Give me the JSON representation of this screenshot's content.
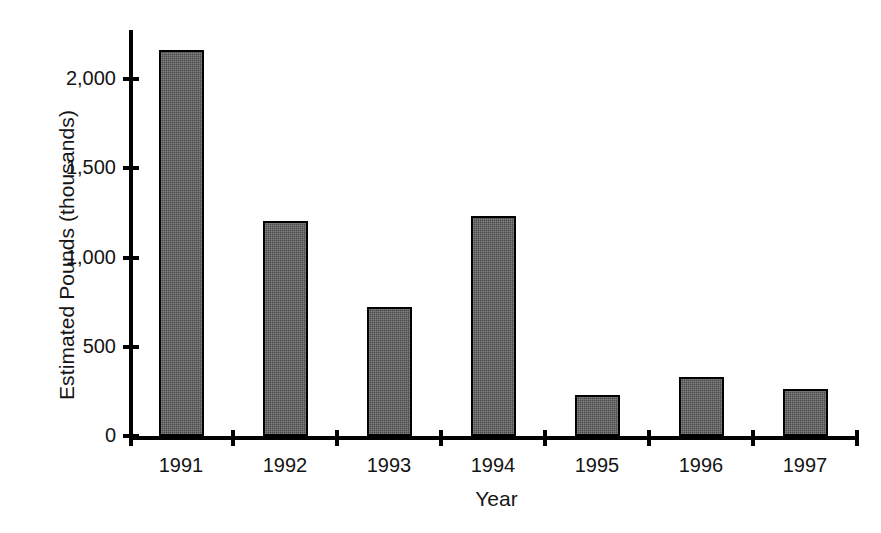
{
  "chart_data": {
    "type": "bar",
    "title": "",
    "xlabel": "Year",
    "ylabel": "Estimated Pounds (thousands)",
    "categories": [
      "1991",
      "1992",
      "1993",
      "1994",
      "1995",
      "1996",
      "1997"
    ],
    "values": [
      2160,
      1205,
      720,
      1230,
      230,
      330,
      265
    ],
    "series": [
      {
        "name": "Estimated Pounds",
        "values": [
          2160,
          1205,
          720,
          1230,
          230,
          330,
          265
        ]
      }
    ],
    "ylim": [
      0,
      2200
    ],
    "yticks": [
      0,
      500,
      1000,
      1500,
      2000
    ],
    "ytick_labels": [
      "0",
      "500",
      "1,000",
      "1,500",
      "2,000"
    ],
    "grid": false,
    "legend": null,
    "bar_color": "#4a4a4a",
    "bar_edge_color": "#000000",
    "axis_color": "#000000",
    "background_color": "#ffffff"
  }
}
